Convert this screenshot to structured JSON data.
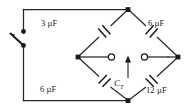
{
  "figure": {
    "type": "circuit-diagram",
    "width": 196,
    "height": 112,
    "line_color": "#262626",
    "text_color": "#1a1a1a",
    "background": "#ffffff"
  },
  "components": {
    "capacitors": [
      {
        "id": "c1",
        "label": "3 µF",
        "value": 3,
        "unit": "µF",
        "position": "top-left-branch"
      },
      {
        "id": "c2",
        "label": "6 µF",
        "value": 6,
        "unit": "µF",
        "position": "top-right-branch"
      },
      {
        "id": "c3",
        "label": "6 µF",
        "value": 6,
        "unit": "µF",
        "position": "bottom-left-branch"
      },
      {
        "id": "c4",
        "label": "12 µF",
        "value": 12,
        "unit": "µF",
        "position": "bottom-right-branch"
      }
    ],
    "measurement": {
      "id": "ct",
      "symbol": "C",
      "subscript": "T",
      "label": "C_T",
      "description": "total capacitance measured across center terminals",
      "arrow_direction": "up"
    },
    "switch": {
      "id": "sw1",
      "state": "open",
      "description": "single pole switch on left branch"
    },
    "terminals": [
      {
        "id": "terminal-left",
        "style": "open-circle"
      },
      {
        "id": "terminal-right",
        "style": "open-circle"
      }
    ],
    "nodes": [
      {
        "id": "node-top",
        "style": "filled"
      },
      {
        "id": "node-left",
        "style": "filled"
      },
      {
        "id": "node-right",
        "style": "filled"
      },
      {
        "id": "node-bottom",
        "style": "filled"
      },
      {
        "id": "node-switch-upper",
        "style": "filled"
      },
      {
        "id": "node-switch-lower",
        "style": "filled"
      }
    ]
  }
}
